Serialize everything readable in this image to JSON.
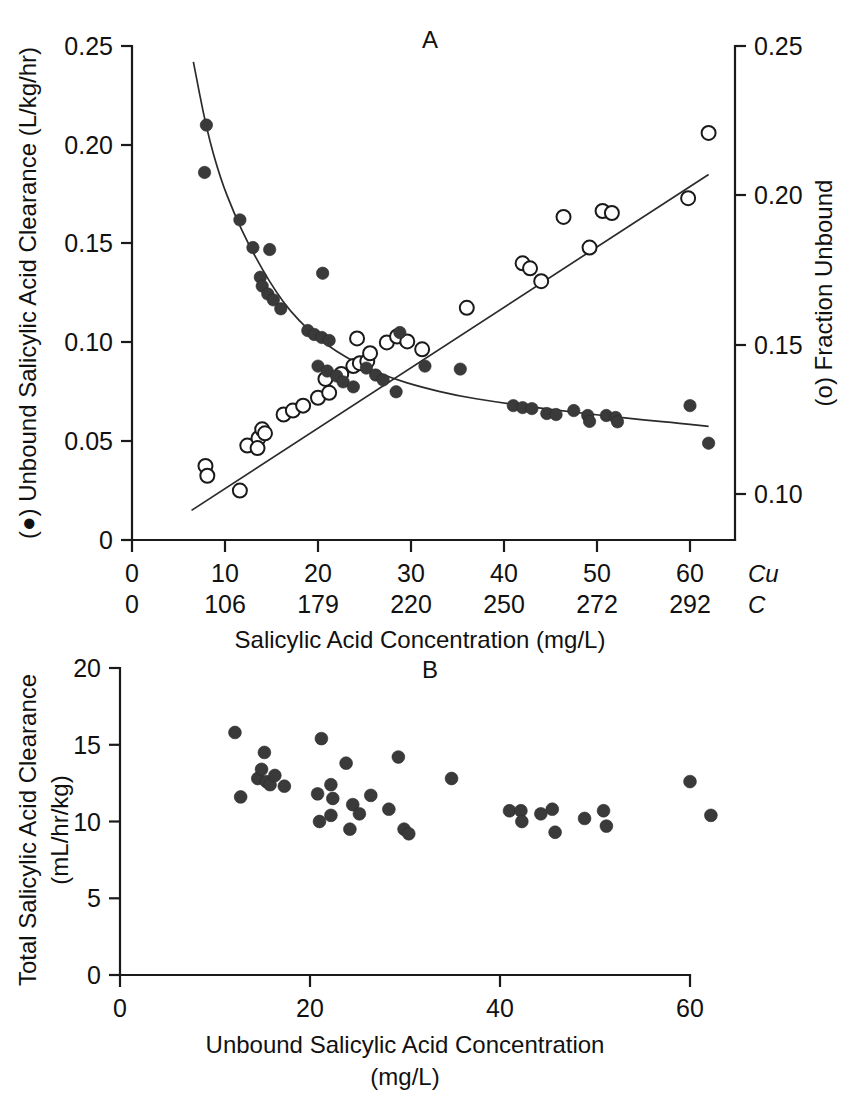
{
  "figure": {
    "background": "#ffffff",
    "ink_color": "#111111",
    "marker_filled_color": "#3a3a3a",
    "marker_open_color": "#ffffff"
  },
  "panelA": {
    "letter": "A",
    "left_axis_title": "(●) Unbound Salicylic Acid Clearance (L/kg/hr)",
    "right_axis_title": "(o) Fraction Unbound",
    "x_axis_title": "Salicylic Acid Concentration (mg/L)",
    "left_ticks": [
      "0",
      "0.05",
      "0.10",
      "0.15",
      "0.20",
      "0.25"
    ],
    "right_ticks": [
      "0.10",
      "0.15",
      "0.20",
      "0.25"
    ],
    "x_ticks_cu": [
      "0",
      "10",
      "20",
      "30",
      "40",
      "50",
      "60"
    ],
    "x_ticks_c": [
      "0",
      "106",
      "179",
      "220",
      "250",
      "272",
      "292"
    ],
    "row_label_cu": "Cu",
    "row_label_c": "C"
  },
  "panelB": {
    "letter": "B",
    "y_axis_title_line1": "Total Salicylic Acid Clearance",
    "y_axis_title_line2": "(mL/hr/kg)",
    "x_axis_title_line1": "Unbound Salicylic Acid Concentration",
    "x_axis_title_line2": "(mg/L)",
    "y_ticks": [
      "0",
      "5",
      "10",
      "15",
      "20"
    ],
    "x_ticks": [
      "0",
      "20",
      "40",
      "60"
    ]
  },
  "chart_data": [
    {
      "type": "scatter",
      "panel": "A",
      "title": "A",
      "xlabel": "Salicylic Acid Concentration (mg/L)",
      "ylabel": "(●) Unbound Salicylic Acid Clearance (L/kg/hr)",
      "y2label": "(o) Fraction Unbound",
      "xlim": [
        0,
        60.6
      ],
      "ylim": [
        0,
        0.25
      ],
      "y2lim": [
        0.085,
        0.25
      ],
      "grid": false,
      "legend": "inline-symbol",
      "x_secondary_axis": {
        "name": "C",
        "ticks_cu": [
          0,
          10,
          20,
          30,
          40,
          50,
          60
        ],
        "ticks_c": [
          0,
          106,
          179,
          220,
          250,
          272,
          292
        ]
      },
      "series": [
        {
          "name": "Unbound Salicylic Acid Clearance (L/kg/hr)",
          "marker": "filled-circle",
          "axis": "left",
          "points": [
            [
              8.0,
              0.21
            ],
            [
              7.8,
              0.186
            ],
            [
              11.6,
              0.162
            ],
            [
              13.0,
              0.148
            ],
            [
              14.8,
              0.147
            ],
            [
              13.8,
              0.133
            ],
            [
              14.0,
              0.1285
            ],
            [
              14.6,
              0.1245
            ],
            [
              15.2,
              0.1215
            ],
            [
              16.0,
              0.117
            ],
            [
              20.5,
              0.135
            ],
            [
              18.9,
              0.106
            ],
            [
              19.6,
              0.104
            ],
            [
              20.4,
              0.1025
            ],
            [
              21.2,
              0.101
            ],
            [
              20.0,
              0.088
            ],
            [
              21.0,
              0.0855
            ],
            [
              22.0,
              0.083
            ],
            [
              22.7,
              0.08
            ],
            [
              23.8,
              0.0775
            ],
            [
              28.8,
              0.105
            ],
            [
              25.2,
              0.087
            ],
            [
              26.2,
              0.0835
            ],
            [
              27.0,
              0.081
            ],
            [
              31.5,
              0.088
            ],
            [
              35.3,
              0.0865
            ],
            [
              28.4,
              0.075
            ],
            [
              41.0,
              0.068
            ],
            [
              42.0,
              0.067
            ],
            [
              43.0,
              0.0665
            ],
            [
              44.6,
              0.064
            ],
            [
              45.6,
              0.0635
            ],
            [
              47.5,
              0.0655
            ],
            [
              49.0,
              0.063
            ],
            [
              49.2,
              0.06
            ],
            [
              51.0,
              0.063
            ],
            [
              52.0,
              0.062
            ],
            [
              52.2,
              0.0598
            ],
            [
              60.0,
              0.068
            ],
            [
              62.0,
              0.049
            ]
          ]
        },
        {
          "name": "Fraction Unbound",
          "marker": "open-circle",
          "axis": "right",
          "points": [
            [
              7.9,
              0.0375
            ],
            [
              8.1,
              0.0325
            ],
            [
              11.6,
              0.025
            ],
            [
              12.4,
              0.0478
            ],
            [
              13.6,
              0.0515
            ],
            [
              13.5,
              0.0465
            ],
            [
              14.0,
              0.056
            ],
            [
              14.3,
              0.054
            ],
            [
              16.3,
              0.0635
            ],
            [
              17.3,
              0.0655
            ],
            [
              18.4,
              0.068
            ],
            [
              20.0,
              0.072
            ],
            [
              21.2,
              0.0745
            ],
            [
              20.8,
              0.0815
            ],
            [
              22.5,
              0.084
            ],
            [
              23.8,
              0.088
            ],
            [
              24.5,
              0.0895
            ],
            [
              25.3,
              0.0905
            ],
            [
              25.6,
              0.0945
            ],
            [
              24.2,
              0.102
            ],
            [
              27.4,
              0.1
            ],
            [
              28.5,
              0.103
            ],
            [
              29.6,
              0.1005
            ],
            [
              31.2,
              0.0965
            ],
            [
              36.0,
              0.1175
            ],
            [
              42.0,
              0.14
            ],
            [
              42.8,
              0.1375
            ],
            [
              44.0,
              0.131
            ],
            [
              46.4,
              0.1635
            ],
            [
              49.2,
              0.148
            ],
            [
              50.6,
              0.1665
            ],
            [
              51.6,
              0.1655
            ],
            [
              59.8,
              0.173
            ],
            [
              62.0,
              0.206
            ]
          ]
        }
      ],
      "fitted_curves": [
        {
          "name": "clearance-decay-curve",
          "axis": "left",
          "points": [
            [
              6.6,
              0.242
            ],
            [
              8.0,
              0.208
            ],
            [
              9.5,
              0.183
            ],
            [
              11.0,
              0.165
            ],
            [
              12.5,
              0.15
            ],
            [
              14.0,
              0.137
            ],
            [
              15.5,
              0.1255
            ],
            [
              17.0,
              0.116
            ],
            [
              19.0,
              0.106
            ],
            [
              21.0,
              0.0985
            ],
            [
              23.0,
              0.0925
            ],
            [
              25.0,
              0.0875
            ],
            [
              28.0,
              0.0818
            ],
            [
              31.0,
              0.0775
            ],
            [
              35.0,
              0.073
            ],
            [
              39.0,
              0.07
            ],
            [
              43.0,
              0.0672
            ],
            [
              47.0,
              0.065
            ],
            [
              51.0,
              0.0628
            ],
            [
              55.0,
              0.0608
            ],
            [
              59.0,
              0.059
            ],
            [
              62.0,
              0.0575
            ]
          ]
        },
        {
          "name": "fraction-unbound-line",
          "axis": "left-scale-of-right",
          "points": [
            [
              6.4,
              0.015
            ],
            [
              62.0,
              0.185
            ]
          ]
        }
      ]
    },
    {
      "type": "scatter",
      "panel": "B",
      "title": "B",
      "xlabel": "Unbound Salicylic Acid Concentration (mg/L)",
      "ylabel": "Total Salicylic Acid Clearance (mL/hr/kg)",
      "xlim": [
        0,
        65
      ],
      "ylim": [
        0,
        20
      ],
      "grid": false,
      "series": [
        {
          "name": "Total Salicylic Acid Clearance",
          "marker": "filled-circle",
          "points": [
            [
              12.1,
              15.8
            ],
            [
              12.7,
              11.6
            ],
            [
              14.5,
              12.8
            ],
            [
              14.9,
              13.4
            ],
            [
              15.2,
              14.5
            ],
            [
              15.4,
              12.6
            ],
            [
              15.8,
              12.4
            ],
            [
              16.3,
              13.0
            ],
            [
              17.3,
              12.3
            ],
            [
              21.2,
              15.4
            ],
            [
              20.8,
              11.8
            ],
            [
              21.0,
              10.0
            ],
            [
              22.2,
              12.4
            ],
            [
              22.4,
              11.5
            ],
            [
              22.2,
              10.4
            ],
            [
              23.8,
              13.8
            ],
            [
              24.5,
              11.1
            ],
            [
              24.2,
              9.5
            ],
            [
              25.2,
              10.5
            ],
            [
              26.4,
              11.7
            ],
            [
              29.3,
              14.2
            ],
            [
              28.3,
              10.8
            ],
            [
              29.9,
              9.5
            ],
            [
              30.4,
              9.2
            ],
            [
              34.9,
              12.8
            ],
            [
              41.0,
              10.7
            ],
            [
              42.2,
              10.7
            ],
            [
              42.3,
              10.0
            ],
            [
              44.3,
              10.5
            ],
            [
              45.5,
              10.8
            ],
            [
              45.8,
              9.3
            ],
            [
              48.9,
              10.2
            ],
            [
              50.9,
              10.7
            ],
            [
              51.2,
              9.7
            ],
            [
              60.0,
              12.6
            ],
            [
              62.2,
              10.4
            ]
          ]
        }
      ]
    }
  ]
}
